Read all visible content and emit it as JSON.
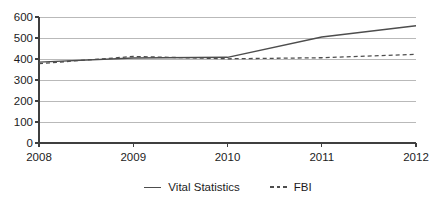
{
  "chart_data": {
    "type": "line",
    "title": "",
    "xlabel": "",
    "ylabel": "",
    "x": [
      2008,
      2009,
      2010,
      2011,
      2012
    ],
    "xtick_labels": [
      "2008",
      "2009",
      "2010",
      "2011",
      "2012"
    ],
    "ytick_labels": [
      "0",
      "100",
      "200",
      "300",
      "400",
      "500",
      "600"
    ],
    "ylim": [
      0,
      600
    ],
    "ytick_step": 100,
    "grid": "horizontal",
    "legend_position": "bottom-center",
    "series": [
      {
        "name": "Vital Statistics",
        "style": "solid",
        "values": [
          385,
          405,
          408,
          505,
          558
        ]
      },
      {
        "name": "FBI",
        "style": "dashed",
        "values": [
          378,
          412,
          401,
          406,
          422
        ]
      }
    ]
  },
  "colors": {
    "line": "#4d4d4d",
    "grid": "#b9b9b9",
    "axis": "#3f3f3f",
    "text": "#1c1c1c",
    "background": "#ffffff"
  },
  "layout_px": {
    "plot_left": 39,
    "plot_right": 416,
    "plot_top": 17,
    "plot_bottom": 143,
    "tick_len": 4,
    "ytick_label_right": 33,
    "xtick_label_baseline": 161
  }
}
